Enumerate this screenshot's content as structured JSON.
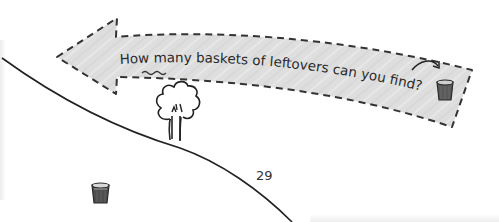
{
  "banner": {
    "question_prefix": "How ",
    "question_emphasis": "many",
    "question_suffix": " baskets of leftovers can you find?",
    "fill_color": "#dcdcdc",
    "border_color": "#333333"
  },
  "page": {
    "number": "29"
  },
  "illustration": {
    "hill_color": "#222222",
    "tree": "tree-icon",
    "baskets_visible": 2,
    "basket_color": "#555555"
  }
}
